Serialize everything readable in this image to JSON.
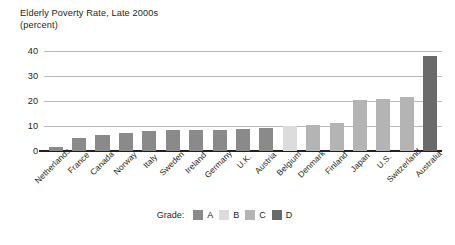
{
  "chart_data": {
    "type": "bar",
    "title": "Elderly Poverty Rate, Late 2000s",
    "subtitle": "(percent)",
    "xlabel": "",
    "ylabel": "",
    "ylim": [
      0,
      40
    ],
    "yticks": [
      0,
      10,
      20,
      30,
      40
    ],
    "grid": true,
    "legend_position": "bottom-center",
    "legend_title": "Grade:",
    "categories": [
      "Netherlands",
      "France",
      "Canada",
      "Norway",
      "Italy",
      "Sweden",
      "Ireland",
      "Germany",
      "U.K.",
      "Austria",
      "Belgium",
      "Denmark",
      "Finland",
      "Japan",
      "U.S.",
      "Switzerland",
      "Australia"
    ],
    "values": [
      1.7,
      5.3,
      6.5,
      7.2,
      8.1,
      8.4,
      8.5,
      8.6,
      8.7,
      9.1,
      10.0,
      10.4,
      11.2,
      20.4,
      21.0,
      21.6,
      38.0
    ],
    "grades": [
      "A",
      "A",
      "A",
      "A",
      "A",
      "A",
      "A",
      "A",
      "A",
      "A",
      "B",
      "C",
      "C",
      "C",
      "C",
      "C",
      "D"
    ],
    "series": [
      {
        "name": "Elderly Poverty Rate",
        "values": [
          1.7,
          5.3,
          6.5,
          7.2,
          8.1,
          8.4,
          8.5,
          8.6,
          8.7,
          9.1,
          10.0,
          10.4,
          11.2,
          20.4,
          21.0,
          21.6,
          38.0
        ]
      }
    ],
    "legend": [
      {
        "label": "A",
        "color": "#8a8a8a"
      },
      {
        "label": "B",
        "color": "#dcdcdc"
      },
      {
        "label": "C",
        "color": "#b4b4b4"
      },
      {
        "label": "D",
        "color": "#6a6a6a"
      }
    ],
    "colors": {
      "A": "#8a8a8a",
      "B": "#dcdcdc",
      "C": "#b4b4b4",
      "D": "#6a6a6a",
      "axis": "#231f20",
      "grid": "#b9b9b9",
      "background": "#ffffff",
      "text": "#231f20"
    }
  }
}
